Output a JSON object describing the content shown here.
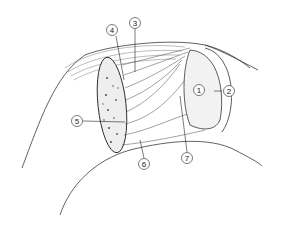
{
  "figure": {
    "type": "anatomical line illustration",
    "background": "#ffffff",
    "ink": "#2a2a2a",
    "callouts": [
      {
        "label": "1",
        "x": 199,
        "y": 90
      },
      {
        "label": "2",
        "x": 229,
        "y": 91
      },
      {
        "label": "3",
        "x": 130,
        "y": 23
      },
      {
        "label": "4",
        "x": 112,
        "y": 30
      },
      {
        "label": "5",
        "x": 77,
        "y": 121
      },
      {
        "label": "6",
        "x": 144,
        "y": 164
      },
      {
        "label": "7",
        "x": 187,
        "y": 158
      }
    ]
  }
}
